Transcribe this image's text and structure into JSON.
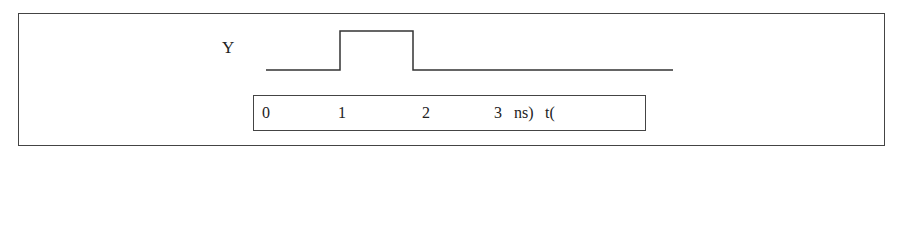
{
  "diagram": {
    "signal": {
      "name": "Y",
      "transitions_ns": [
        0,
        1,
        2,
        3
      ],
      "levels": [
        "low",
        "high",
        "low",
        "low"
      ]
    },
    "axis": {
      "ticks": [
        "0",
        "1",
        "2",
        "3"
      ],
      "unit_label": "ns)",
      "axis_label": "t("
    }
  }
}
